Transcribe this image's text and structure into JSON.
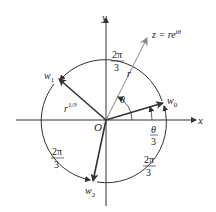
{
  "diagram": {
    "type": "complex-cube-roots",
    "axes": {
      "x_label": "x",
      "y_label": "y",
      "origin_label": "O"
    },
    "point_z": {
      "label": "z = re",
      "exponent": "iθ"
    },
    "labels": {
      "r": "r",
      "theta": "θ",
      "r_cube_root_base": "r",
      "r_cube_root_exp": "1/3",
      "theta_over_3_num": "θ",
      "theta_over_3_den": "3",
      "arc_num": "2π",
      "arc_den": "3"
    },
    "roots": [
      {
        "name": "w",
        "sub": "0"
      },
      {
        "name": "w",
        "sub": "1"
      },
      {
        "name": "w",
        "sub": "2"
      }
    ],
    "colors": {
      "line": "#333333",
      "z_ray": "#888888",
      "text": "#222222"
    }
  }
}
